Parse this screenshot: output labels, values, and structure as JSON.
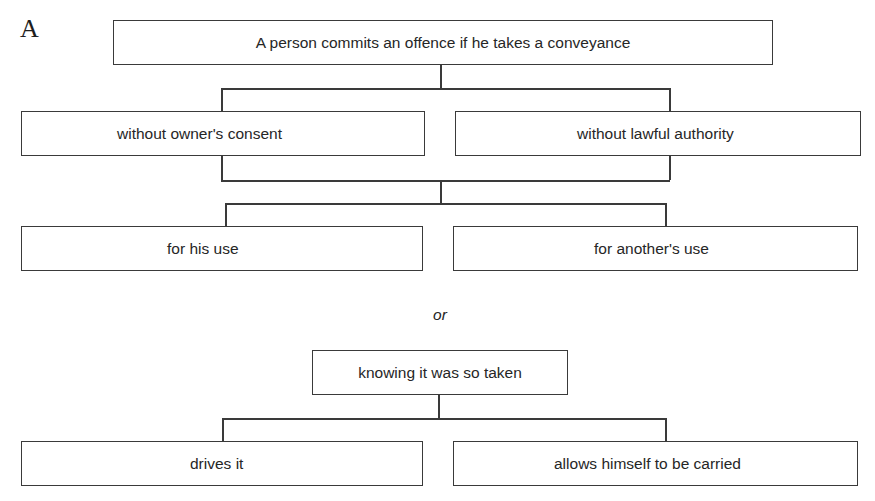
{
  "figure": {
    "panel_label": "A",
    "root": {
      "text": "A person commits an offence if he takes a conveyance"
    },
    "row1": [
      {
        "text": "without owner's consent"
      },
      {
        "text": "without lawful authority"
      }
    ],
    "row2": [
      {
        "text": "for his use"
      },
      {
        "text": "for another's use"
      }
    ],
    "separator": "or",
    "second_root": {
      "text": "knowing it was so taken"
    },
    "row3": [
      {
        "text": "drives it"
      },
      {
        "text": "allows himself to be carried"
      }
    ]
  }
}
